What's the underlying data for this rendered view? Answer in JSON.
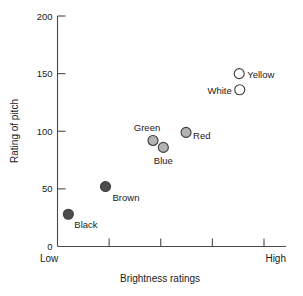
{
  "chart_data": {
    "type": "scatter",
    "title": "",
    "xlabel": "Brightness ratings",
    "ylabel": "Rating of pitch",
    "xlim": [
      0,
      4
    ],
    "ylim": [
      0,
      200
    ],
    "grid": false,
    "legend": "none",
    "x_tick_labels": [
      "",
      "",
      "",
      "",
      ""
    ],
    "x_tick_values": [
      0,
      1,
      2,
      3,
      4
    ],
    "x_axis_end_labels": {
      "low": "Low",
      "high": "High"
    },
    "y_tick_labels": [
      "0",
      "50",
      "100",
      "150",
      "200"
    ],
    "y_tick_values": [
      0,
      50,
      100,
      150,
      200
    ],
    "points": [
      {
        "label": "Black",
        "x": 0.21,
        "y": 28,
        "fill": "#4d4d4d",
        "stroke": "#3d3d3d",
        "label_dx": 6,
        "label_dy": 14,
        "label_anchor": "start"
      },
      {
        "label": "Brown",
        "x": 0.93,
        "y": 52,
        "fill": "#4d4d4d",
        "stroke": "#3d3d3d",
        "label_dx": 7,
        "label_dy": 14,
        "label_anchor": "start"
      },
      {
        "label": "Green",
        "x": 1.85,
        "y": 92,
        "fill": "#b3b3b3",
        "stroke": "#3d3d3d",
        "label_dx": -6,
        "label_dy": -9,
        "label_anchor": "middle"
      },
      {
        "label": "Blue",
        "x": 2.05,
        "y": 86,
        "fill": "#b3b3b3",
        "stroke": "#3d3d3d",
        "label_dx": 0,
        "label_dy": 17,
        "label_anchor": "middle"
      },
      {
        "label": "Red",
        "x": 2.49,
        "y": 99,
        "fill": "#b3b3b3",
        "stroke": "#3d3d3d",
        "label_dx": 7,
        "label_dy": 7,
        "label_anchor": "start"
      },
      {
        "label": "Yellow",
        "x": 3.52,
        "y": 150,
        "fill": "#ffffff",
        "stroke": "#3d3d3d",
        "label_dx": 8,
        "label_dy": 4,
        "label_anchor": "start"
      },
      {
        "label": "White",
        "x": 3.53,
        "y": 136,
        "fill": "#ffffff",
        "stroke": "#3d3d3d",
        "label_dx": -8,
        "label_dy": 4,
        "label_anchor": "end"
      }
    ]
  }
}
